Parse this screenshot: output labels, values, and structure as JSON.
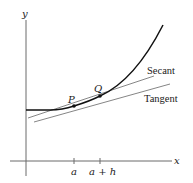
{
  "diagram": {
    "axes": {
      "x_label": "x",
      "y_label": "y",
      "tick_labels": [
        "a",
        "a + h"
      ]
    },
    "points": [
      {
        "label": "P"
      },
      {
        "label": "Q"
      }
    ],
    "lines": {
      "secant_label": "Secant",
      "tangent_label": "Tangent"
    },
    "colors": {
      "curve": "#111111",
      "axes": "#555555",
      "lines": "#666666"
    }
  }
}
